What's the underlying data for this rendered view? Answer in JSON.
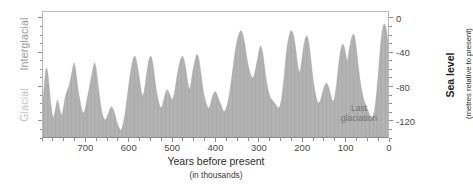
{
  "labels": {
    "interglacial": "Interglacial",
    "glacial": "Glacial",
    "last_glaciation_line1": "Last",
    "last_glaciation_line2": "glaciation"
  },
  "chart_data": {
    "type": "area",
    "title": "",
    "xlabel": "Years before present",
    "xlabel_sub": "(in thousands)",
    "ylabel": "Sea level",
    "ylabel_sub": "(metres relative to present)",
    "xlim": [
      800,
      0
    ],
    "ylim": [
      -140,
      8
    ],
    "x_reversed": true,
    "grid": false,
    "legend": null,
    "xticks": [
      700,
      600,
      500,
      400,
      300,
      200,
      100,
      0
    ],
    "xtick_labels": [
      "700",
      "600",
      "500",
      "400",
      "300",
      "200",
      "100",
      "0"
    ],
    "x_minor_tick_interval": 25,
    "yticks": [
      0,
      -40,
      -80,
      -120
    ],
    "ytick_labels": [
      "0",
      "-40",
      "-80",
      "-120"
    ],
    "y_minor_tick_interval": 10,
    "fill_color": "#b3b3b3",
    "annotations": [
      {
        "text": "Last glaciation",
        "x": 28,
        "y": -118
      },
      {
        "text": "Interglacial",
        "position": "left-upper"
      },
      {
        "text": "Glacial",
        "position": "left-lower"
      }
    ],
    "x": [
      800,
      797,
      794,
      791,
      788,
      785,
      782,
      779,
      776,
      773,
      770,
      767,
      764,
      761,
      758,
      755,
      752,
      749,
      746,
      743,
      740,
      737,
      734,
      731,
      728,
      725,
      722,
      719,
      716,
      713,
      710,
      707,
      704,
      701,
      698,
      695,
      692,
      689,
      686,
      683,
      680,
      677,
      674,
      671,
      668,
      665,
      662,
      659,
      656,
      653,
      650,
      647,
      644,
      641,
      638,
      635,
      632,
      629,
      626,
      623,
      620,
      617,
      614,
      611,
      608,
      605,
      602,
      599,
      596,
      593,
      590,
      587,
      584,
      581,
      578,
      575,
      572,
      569,
      566,
      563,
      560,
      557,
      554,
      551,
      548,
      545,
      542,
      539,
      536,
      533,
      530,
      527,
      524,
      521,
      518,
      515,
      512,
      509,
      506,
      503,
      500,
      497,
      494,
      491,
      488,
      485,
      482,
      479,
      476,
      473,
      470,
      467,
      464,
      461,
      458,
      455,
      452,
      449,
      446,
      443,
      440,
      437,
      434,
      431,
      428,
      425,
      422,
      419,
      416,
      413,
      410,
      407,
      404,
      401,
      398,
      395,
      392,
      389,
      386,
      383,
      380,
      377,
      374,
      371,
      368,
      365,
      362,
      359,
      356,
      353,
      350,
      347,
      344,
      341,
      338,
      335,
      332,
      329,
      326,
      323,
      320,
      317,
      314,
      311,
      308,
      305,
      302,
      299,
      296,
      293,
      290,
      287,
      284,
      281,
      278,
      275,
      272,
      269,
      266,
      263,
      260,
      257,
      254,
      251,
      248,
      245,
      242,
      239,
      236,
      233,
      230,
      227,
      224,
      221,
      218,
      215,
      212,
      209,
      206,
      203,
      200,
      197,
      194,
      191,
      188,
      185,
      182,
      179,
      176,
      173,
      170,
      167,
      164,
      161,
      158,
      155,
      152,
      149,
      146,
      143,
      140,
      137,
      134,
      131,
      128,
      125,
      122,
      119,
      116,
      113,
      110,
      107,
      104,
      101,
      98,
      95,
      92,
      89,
      86,
      83,
      80,
      77,
      74,
      71,
      68,
      65,
      62,
      59,
      56,
      53,
      50,
      47,
      44,
      41,
      38,
      35,
      32,
      29,
      26,
      23,
      20,
      17,
      14,
      11,
      8,
      5,
      2,
      0
    ],
    "y": [
      -96,
      -78,
      -62,
      -58,
      -68,
      -84,
      -100,
      -112,
      -118,
      -112,
      -104,
      -96,
      -100,
      -108,
      -114,
      -112,
      -104,
      -94,
      -88,
      -84,
      -80,
      -74,
      -66,
      -58,
      -52,
      -58,
      -70,
      -82,
      -92,
      -100,
      -108,
      -112,
      -110,
      -104,
      -96,
      -88,
      -80,
      -72,
      -64,
      -56,
      -52,
      -58,
      -70,
      -84,
      -96,
      -106,
      -114,
      -118,
      -120,
      -118,
      -114,
      -110,
      -106,
      -104,
      -106,
      -110,
      -116,
      -122,
      -126,
      -130,
      -132,
      -130,
      -124,
      -116,
      -106,
      -94,
      -82,
      -70,
      -60,
      -52,
      -46,
      -44,
      -48,
      -56,
      -66,
      -76,
      -86,
      -92,
      -88,
      -78,
      -66,
      -56,
      -48,
      -44,
      -46,
      -54,
      -66,
      -78,
      -88,
      -96,
      -102,
      -106,
      -104,
      -98,
      -92,
      -86,
      -84,
      -86,
      -90,
      -94,
      -96,
      -92,
      -84,
      -74,
      -64,
      -56,
      -50,
      -46,
      -44,
      -48,
      -56,
      -66,
      -76,
      -84,
      -80,
      -70,
      -60,
      -52,
      -46,
      -42,
      -44,
      -52,
      -64,
      -76,
      -86,
      -94,
      -100,
      -104,
      -106,
      -104,
      -98,
      -92,
      -88,
      -86,
      -88,
      -92,
      -96,
      -100,
      -104,
      -108,
      -110,
      -108,
      -104,
      -98,
      -90,
      -80,
      -68,
      -56,
      -44,
      -34,
      -26,
      -20,
      -16,
      -14,
      -16,
      -22,
      -30,
      -40,
      -50,
      -58,
      -64,
      -68,
      -70,
      -68,
      -62,
      -54,
      -46,
      -38,
      -32,
      -34,
      -42,
      -54,
      -66,
      -76,
      -84,
      -90,
      -94,
      -96,
      -98,
      -100,
      -102,
      -104,
      -106,
      -104,
      -98,
      -88,
      -74,
      -58,
      -42,
      -30,
      -22,
      -16,
      -14,
      -16,
      -22,
      -32,
      -44,
      -56,
      -64,
      -60,
      -50,
      -38,
      -28,
      -22,
      -20,
      -24,
      -34,
      -48,
      -62,
      -74,
      -84,
      -92,
      -98,
      -100,
      -98,
      -94,
      -88,
      -82,
      -78,
      -76,
      -78,
      -82,
      -88,
      -94,
      -98,
      -96,
      -88,
      -76,
      -62,
      -48,
      -38,
      -32,
      -30,
      -34,
      -42,
      -52,
      -44,
      -34,
      -26,
      -20,
      -18,
      -22,
      -32,
      -46,
      -60,
      -72,
      -82,
      -90,
      -96,
      -100,
      -104,
      -108,
      -112,
      -116,
      -118,
      -116,
      -110,
      -100,
      -86,
      -68,
      -48,
      -30,
      -16,
      -8,
      -6,
      -10,
      -18,
      -30,
      -42,
      -52,
      -46,
      -36,
      -28,
      -24,
      -26,
      -34,
      -46,
      -58,
      -68,
      -76,
      -82,
      -86,
      -84,
      -80,
      -76,
      -74,
      -76,
      -80,
      -86,
      -92,
      -98,
      -104,
      -110,
      -116,
      -120,
      -124,
      -126,
      -128,
      -126,
      -122,
      -116,
      -108,
      -98,
      -84,
      -66,
      -44,
      -22,
      -6,
      -2
    ]
  }
}
